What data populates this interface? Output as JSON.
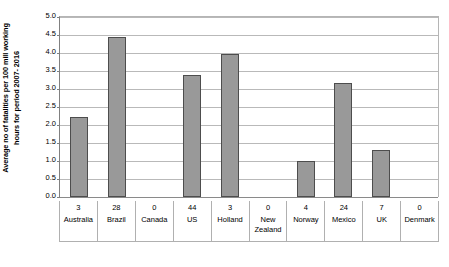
{
  "chart_data": {
    "type": "bar",
    "title": "",
    "xlabel": "",
    "ylabel": "Average no of fatalities per 100 mill working hours for period 2007- 2016",
    "ylabel_lines": [
      "Average no of fatalities per 100 mill working",
      "hours for period 2007- 2016"
    ],
    "categories": [
      "Australia",
      "Brazil",
      "Canada",
      "US",
      "Holland",
      "New Zealand",
      "Norway",
      "Mexico",
      "UK",
      "Denmark"
    ],
    "values": [
      2.2,
      4.42,
      0.0,
      3.37,
      3.95,
      0.0,
      1.0,
      3.15,
      1.3,
      0.0
    ],
    "counts": [
      "3",
      "28",
      "0",
      "44",
      "3",
      "0",
      "4",
      "24",
      "7",
      "0"
    ],
    "ylim": [
      0.0,
      5.0
    ],
    "ytick_step": 0.5,
    "yticks": [
      "0.0",
      "0.5",
      "1.0",
      "1.5",
      "2.0",
      "2.5",
      "3.0",
      "3.5",
      "4.0",
      "4.5",
      "5.0"
    ],
    "grid": true,
    "legend": "none",
    "bar_color": "#999999",
    "bar_border_color": "#4d4d4d",
    "gridline_color": "#b9b9b9",
    "axis_color": "#808080",
    "background_color": "#ffffff"
  }
}
